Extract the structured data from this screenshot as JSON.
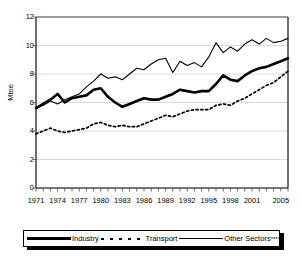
{
  "chart_data": {
    "type": "line",
    "title": "",
    "xlabel": "",
    "ylabel": "Mtoe",
    "ylim": [
      0,
      12
    ],
    "ytick_values": [
      0,
      2,
      4,
      6,
      8,
      10,
      12
    ],
    "xlim": [
      1971,
      2006
    ],
    "xtick_labels": [
      "1971",
      "1974",
      "1977",
      "1980",
      "1983",
      "1986",
      "1989",
      "1992",
      "1995",
      "1998",
      "2001",
      "2005"
    ],
    "xtick_years": [
      1971,
      1974,
      1977,
      1980,
      1983,
      1986,
      1989,
      1992,
      1995,
      1998,
      2001,
      2005
    ],
    "grid": "horizontal",
    "legend_position": "bottom",
    "x": [
      1971,
      1972,
      1973,
      1974,
      1975,
      1976,
      1977,
      1978,
      1979,
      1980,
      1981,
      1982,
      1983,
      1984,
      1985,
      1986,
      1987,
      1988,
      1989,
      1990,
      1991,
      1992,
      1993,
      1994,
      1995,
      1996,
      1997,
      1998,
      1999,
      2000,
      2001,
      2002,
      2003,
      2004,
      2005,
      2006
    ],
    "series": [
      {
        "name": "Industry",
        "style": "thick-solid",
        "color": "#000000",
        "values": [
          5.6,
          5.9,
          6.2,
          6.6,
          6.0,
          6.3,
          6.4,
          6.5,
          6.9,
          7.0,
          6.4,
          6.0,
          5.7,
          5.9,
          6.1,
          6.3,
          6.2,
          6.2,
          6.4,
          6.6,
          6.9,
          6.8,
          6.7,
          6.8,
          6.8,
          7.3,
          7.9,
          7.6,
          7.5,
          7.9,
          8.2,
          8.4,
          8.5,
          8.7,
          8.9,
          9.1
        ]
      },
      {
        "name": "Transport",
        "style": "dotted",
        "color": "#000000",
        "values": [
          3.8,
          4.0,
          4.2,
          4.0,
          3.9,
          4.0,
          4.1,
          4.2,
          4.5,
          4.6,
          4.4,
          4.3,
          4.4,
          4.3,
          4.3,
          4.5,
          4.7,
          4.9,
          5.1,
          5.0,
          5.2,
          5.4,
          5.5,
          5.5,
          5.5,
          5.8,
          5.9,
          5.8,
          6.1,
          6.3,
          6.6,
          6.9,
          7.2,
          7.4,
          7.8,
          8.2
        ]
      },
      {
        "name": "Other Sectors****",
        "style": "thin-solid",
        "color": "#000000",
        "values": [
          5.6,
          5.8,
          6.1,
          5.9,
          6.2,
          6.4,
          6.6,
          7.1,
          7.5,
          8.0,
          7.7,
          7.8,
          7.6,
          8.0,
          8.4,
          8.3,
          8.7,
          9.0,
          9.1,
          8.1,
          8.9,
          8.6,
          8.8,
          8.5,
          9.2,
          10.2,
          9.5,
          9.9,
          9.6,
          10.1,
          10.4,
          10.1,
          10.5,
          10.2,
          10.3,
          10.5
        ]
      }
    ]
  },
  "legend": {
    "items": [
      {
        "label": "Industry",
        "swatch": "thick-solid"
      },
      {
        "label": "Transport",
        "swatch": "dotted"
      },
      {
        "label": "Other Sectors",
        "suffix": "****",
        "swatch": "thin-solid"
      }
    ]
  }
}
